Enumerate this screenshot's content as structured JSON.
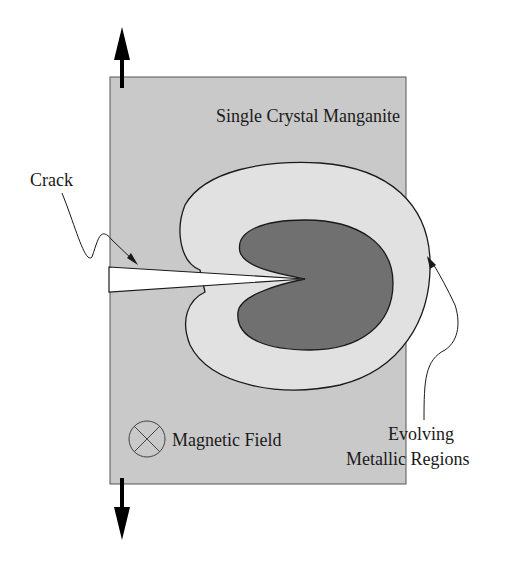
{
  "diagram": {
    "title": "Single Crystal Manganite",
    "labels": {
      "crack": "Crack",
      "magnetic_field": "Magnetic Field",
      "evolving_line1": "Evolving",
      "evolving_line2": "Metallic Regions"
    },
    "symbols": {
      "magnetic_field_symbol": "circle-cross (field into page)",
      "tension_arrows": [
        "up-arrow",
        "down-arrow"
      ]
    },
    "colors": {
      "background": "#ffffff",
      "sample": "#c9c9c9",
      "metallic_outer": "#e1e1e1",
      "metallic_inner": "#707070",
      "lines": "#1a1a1a"
    }
  }
}
